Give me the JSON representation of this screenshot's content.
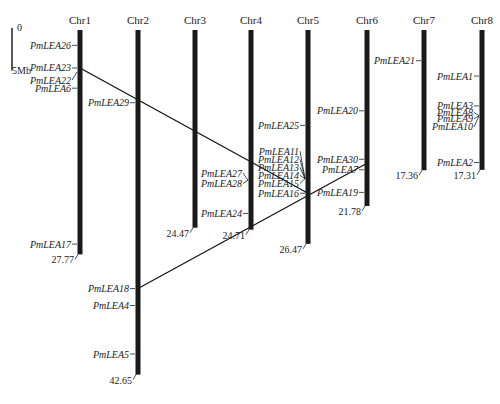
{
  "scale_bar": {
    "top_label": "0",
    "bottom_label": "5Mb",
    "length_mb": 5
  },
  "chromosomes": [
    {
      "name": "Chr1",
      "length": 27.77,
      "length_label": "27.77",
      "genes": [
        {
          "name": "PmLEA26",
          "pos": 1.9
        },
        {
          "name": "PmLEA23",
          "pos": 4.7
        },
        {
          "name": "PmLEA22",
          "pos": 5.2,
          "label_offset": 1.0
        },
        {
          "name": "PmLEA6",
          "pos": 7.2
        },
        {
          "name": "PmLEA17",
          "pos": 26.5
        }
      ]
    },
    {
      "name": "Chr2",
      "length": 42.65,
      "length_label": "42.65",
      "genes": [
        {
          "name": "PmLEA29",
          "pos": 9.0
        },
        {
          "name": "PmLEA18",
          "pos": 32.0
        },
        {
          "name": "PmLEA4",
          "pos": 34.1
        },
        {
          "name": "PmLEA5",
          "pos": 40.1
        }
      ]
    },
    {
      "name": "Chr3",
      "length": 24.47,
      "length_label": "24.47",
      "genes": []
    },
    {
      "name": "Chr4",
      "length": 24.71,
      "length_label": "24.71",
      "genes": [
        {
          "name": "PmLEA27",
          "pos": 18.6,
          "label_offset": -0.9
        },
        {
          "name": "PmLEA28",
          "pos": 18.6,
          "label_offset": 0.4
        },
        {
          "name": "PmLEA24",
          "pos": 22.7
        }
      ]
    },
    {
      "name": "Chr5",
      "length": 26.47,
      "length_label": "26.47",
      "genes": [
        {
          "name": "PmLEA25",
          "pos": 11.8
        },
        {
          "name": "PmLEA11",
          "pos": 18.4,
          "label_offset": -3.4
        },
        {
          "name": "PmLEA12",
          "pos": 18.4,
          "label_offset": -2.4
        },
        {
          "name": "PmLEA13",
          "pos": 18.4,
          "label_offset": -1.4
        },
        {
          "name": "PmLEA14",
          "pos": 18.4,
          "label_offset": -0.4
        },
        {
          "name": "PmLEA15",
          "pos": 18.4,
          "label_offset": 0.6
        },
        {
          "name": "PmLEA16",
          "pos": 20.2
        }
      ]
    },
    {
      "name": "Chr6",
      "length": 21.78,
      "length_label": "21.78",
      "genes": [
        {
          "name": "PmLEA20",
          "pos": 10.0
        },
        {
          "name": "PmLEA30",
          "pos": 16.0
        },
        {
          "name": "PmLEA7",
          "pos": 17.3
        },
        {
          "name": "PmLEA19",
          "pos": 20.1
        }
      ]
    },
    {
      "name": "Chr7",
      "length": 17.36,
      "length_label": "17.36",
      "genes": [
        {
          "name": "PmLEA21",
          "pos": 3.8
        }
      ]
    },
    {
      "name": "Chr8",
      "length": 17.31,
      "length_label": "17.31",
      "genes": [
        {
          "name": "PmLEA1",
          "pos": 5.7
        },
        {
          "name": "PmLEA3",
          "pos": 9.4
        },
        {
          "name": "PmLEA8",
          "pos": 10.6,
          "label_offset": -0.4
        },
        {
          "name": "PmLEA9",
          "pos": 10.6,
          "label_offset": 0.4
        },
        {
          "name": "PmLEA10",
          "pos": 10.6,
          "label_offset": 1.4
        },
        {
          "name": "PmLEA2",
          "pos": 16.4
        }
      ]
    }
  ],
  "duplication_links": [
    {
      "from": {
        "chr": "Chr1",
        "gene": "PmLEA23",
        "pos": 4.7
      },
      "to": {
        "chr": "Chr5",
        "gene": "PmLEA16",
        "pos": 20.2
      }
    },
    {
      "from": {
        "chr": "Chr2",
        "gene": "PmLEA18",
        "pos": 32.0
      },
      "to": {
        "chr": "Chr6",
        "gene": "PmLEA30",
        "pos": 16.5
      }
    }
  ]
}
